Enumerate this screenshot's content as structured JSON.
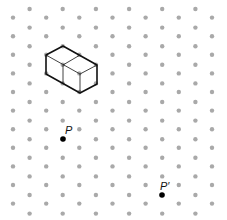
{
  "diagram": {
    "type": "isometric-dot-grid",
    "grid": {
      "columns": 13,
      "x_start": 13,
      "x_step": 16.58,
      "y_step": 18.6,
      "even_col_y_start": 17.6,
      "odd_col_y_start": 9,
      "dot_radius": 2.2,
      "dot_color": "#a9a9a9"
    },
    "shape": {
      "name": "two-cube cuboid",
      "stroke": "#111111",
      "outline": [
        [
          46,
          55
        ],
        [
          63,
          46
        ],
        [
          97,
          65
        ],
        [
          97,
          84
        ],
        [
          80,
          93
        ],
        [
          46,
          74
        ]
      ],
      "inner_edges": [
        [
          [
            46,
            55
          ],
          [
            80,
            74
          ]
        ],
        [
          [
            80,
            74
          ],
          [
            97,
            65
          ]
        ],
        [
          [
            80,
            74
          ],
          [
            80,
            93
          ]
        ],
        [
          [
            63,
            65
          ],
          [
            80,
            55
          ]
        ],
        [
          [
            63,
            65
          ],
          [
            63,
            84
          ]
        ]
      ]
    },
    "points": [
      {
        "id": "P",
        "label": "P",
        "x": 63,
        "y": 139,
        "label_x": 65,
        "label_y": 134
      },
      {
        "id": "P-prime",
        "label": "P′",
        "x": 162,
        "y": 195,
        "label_x": 160,
        "label_y": 190
      }
    ]
  }
}
